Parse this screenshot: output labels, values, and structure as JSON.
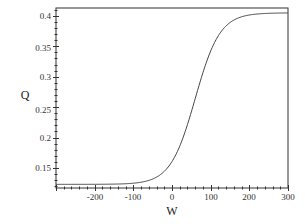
{
  "chart_data": {
    "type": "line",
    "title": "",
    "xlabel": "W",
    "ylabel": "Q",
    "xlim": [
      -300,
      300
    ],
    "ylim": [
      0.117,
      0.413
    ],
    "grid": false,
    "legend": null,
    "x_ticks": [
      -200,
      -100,
      0,
      100,
      200,
      300
    ],
    "x_tick_labels": [
      "-200",
      "-100",
      "0",
      "100",
      "200",
      "300"
    ],
    "y_ticks": [
      0.15,
      0.2,
      0.25,
      0.3,
      0.35,
      0.4
    ],
    "y_tick_labels": [
      "0.15",
      "0.2",
      "0.25",
      "0.3",
      "0.35",
      "0.4"
    ],
    "series": [
      {
        "name": "Q(W)",
        "color": "#333333",
        "x": [
          -300,
          -250,
          -200,
          -150,
          -100,
          -75,
          -50,
          -25,
          0,
          10,
          20,
          30,
          40,
          50,
          60,
          70,
          80,
          90,
          100,
          110,
          120,
          130,
          140,
          150,
          175,
          200,
          250,
          300
        ],
        "y": [
          0.123,
          0.123,
          0.123,
          0.1232,
          0.1243,
          0.1254,
          0.1278,
          0.1328,
          0.1605,
          0.166,
          0.176,
          0.19,
          0.208,
          0.23,
          0.264,
          0.288,
          0.31,
          0.33,
          0.342,
          0.36,
          0.372,
          0.381,
          0.388,
          0.389,
          0.398,
          0.4015,
          0.4045,
          0.405
        ]
      }
    ]
  },
  "labels": {
    "xlabel": "W",
    "ylabel": "Q",
    "x_ticks": [
      "-200",
      "-100",
      "0",
      "100",
      "200",
      "300"
    ],
    "y_ticks": [
      "0.4",
      "0.35",
      "0.3",
      "0.25",
      "0.2",
      "0.15"
    ]
  }
}
